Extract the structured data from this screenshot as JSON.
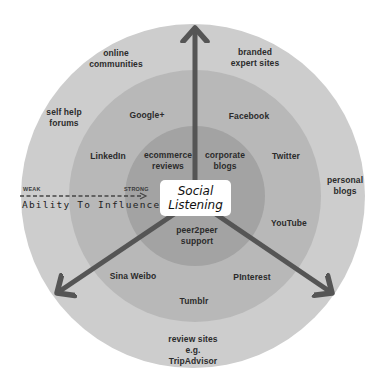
{
  "diagram": {
    "center": {
      "line1": "Social",
      "line2": "Listening"
    },
    "axis": {
      "weak_label": "WEAK",
      "strong_label": "STRONG",
      "title": "Ability To Influence"
    },
    "rings": {
      "outer_color": "#cdcdcd",
      "middle_color": "#b7b7b7",
      "inner_color": "#a2a2a2",
      "arrow_color": "#555555"
    },
    "labels": {
      "online_communities": [
        "online",
        "communities"
      ],
      "branded_expert_sites": [
        "branded",
        "expert sites"
      ],
      "self_help_forums": [
        "self help",
        "forums"
      ],
      "personal_blogs": [
        "personal",
        "blogs"
      ],
      "review_sites": [
        "review sites",
        "e.g.",
        "TripAdvisor"
      ],
      "google_plus": "Google+",
      "facebook": "Facebook",
      "linkedin": "LinkedIn",
      "twitter": "Twitter",
      "youtube": "YouTube",
      "sina_weibo": "Sina Weibo",
      "pinterest": "PInterest",
      "tumblr": "Tumblr",
      "ecommerce_reviews": [
        "ecommerce",
        "reviews"
      ],
      "corporate_blogs": [
        "corporate",
        "blogs"
      ],
      "peer2peer_support": [
        "peer2peer",
        "support"
      ]
    }
  }
}
